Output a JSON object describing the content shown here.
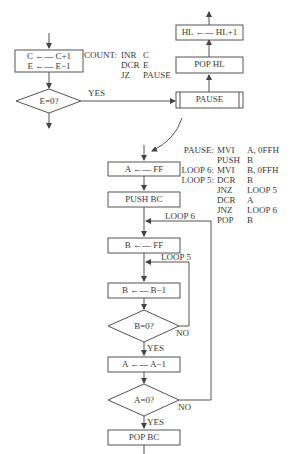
{
  "diagram": {
    "type": "flowchart",
    "left_flow": {
      "count_box": {
        "line1": "C ←— C+1",
        "line2": "E ←— E−1"
      },
      "decision": {
        "label": "E=0?",
        "yes": "YES"
      }
    },
    "count_code": {
      "rows": [
        {
          "label": "COUNT:",
          "op": "INR",
          "arg": "C"
        },
        {
          "label": "",
          "op": "DCR",
          "arg": "E"
        },
        {
          "label": "",
          "op": "JZ",
          "arg": "PAUSE"
        }
      ]
    },
    "right_flow": {
      "hl_box": "HL ←— HL+1",
      "pop_hl_box": "POP HL",
      "pause_box": "PAUSE"
    },
    "pause_code": {
      "rows": [
        {
          "label": "PAUSE:",
          "op": "MVI",
          "arg": "A, 0FFH"
        },
        {
          "label": "",
          "op": "PUSH",
          "arg": "B"
        },
        {
          "label": "LOOP 6:",
          "op": "MVI",
          "arg": "B, 0FFH"
        },
        {
          "label": "LOOP 5:",
          "op": "DCR",
          "arg": "B"
        },
        {
          "label": "",
          "op": "JNZ",
          "arg": "LOOP 5"
        },
        {
          "label": "",
          "op": "DCR",
          "arg": "A"
        },
        {
          "label": "",
          "op": "JNZ",
          "arg": "LOOP 6"
        },
        {
          "label": "",
          "op": "POP",
          "arg": "B"
        }
      ]
    },
    "pause_flow": {
      "a_ff": "A ←— FF",
      "push_bc": "PUSH BC",
      "loop6_label": "LOOP 6",
      "b_ff": "B ←— FF",
      "loop5_label": "LOOP 5",
      "b_dec": "B ←— B−1",
      "b_decision": "B=0?",
      "b_no": "NO",
      "b_yes": "YES",
      "a_dec": "A ←— A−1",
      "a_decision": "A=0?",
      "a_no": "NO",
      "a_yes": "YES",
      "pop_bc": "POP BC"
    }
  }
}
